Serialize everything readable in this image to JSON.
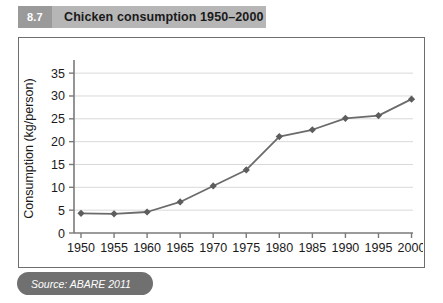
{
  "figure": {
    "number": "8.7",
    "title": "Chicken consumption 1950–2000",
    "source": "Source: ABARE 2011"
  },
  "chart_data": {
    "type": "line",
    "title": "Chicken consumption 1950–2000",
    "xlabel": "",
    "ylabel": "Consumption (kg/person)",
    "x": [
      1950,
      1955,
      1960,
      1965,
      1970,
      1975,
      1980,
      1985,
      1990,
      1995,
      2000
    ],
    "categories": [
      "1950",
      "1955",
      "1960",
      "1965",
      "1970",
      "1975",
      "1980",
      "1985",
      "1990",
      "1995",
      "2000"
    ],
    "values": [
      4.3,
      4.2,
      4.6,
      6.8,
      10.3,
      13.8,
      21.1,
      22.6,
      25.1,
      25.7,
      29.3
    ],
    "series": [
      {
        "name": "Chicken consumption",
        "values": [
          4.3,
          4.2,
          4.6,
          6.8,
          10.3,
          13.8,
          21.1,
          22.6,
          25.1,
          25.7,
          29.3
        ]
      }
    ],
    "ylim": [
      0,
      37
    ],
    "xlim": [
      1948,
      2002
    ],
    "yticks": [
      0,
      5,
      10,
      15,
      20,
      25,
      30,
      35
    ],
    "ytick_labels": [
      "0",
      "5",
      "10",
      "15",
      "20",
      "25",
      "30",
      "35"
    ],
    "xtick_labels": [
      "1950",
      "1955",
      "1960",
      "1965",
      "1970",
      "1975",
      "1980",
      "1985",
      "1990",
      "1995",
      "2000"
    ],
    "grid": "horizontal",
    "legend": "none",
    "marker": "diamond",
    "line_color": "#6b6b6b",
    "marker_color": "#5d5d5d",
    "grid_color": "#d9d9d9",
    "axis_color": "#7a7a7a"
  },
  "colors": {
    "banner_bg": "#b6b6b6",
    "banner_number_bg": "#9a9a9a",
    "banner_text": "#1a1a1a",
    "frame_border": "#6e6e6e",
    "source_pill_bg": "#707070",
    "source_text": "#ffffff"
  }
}
